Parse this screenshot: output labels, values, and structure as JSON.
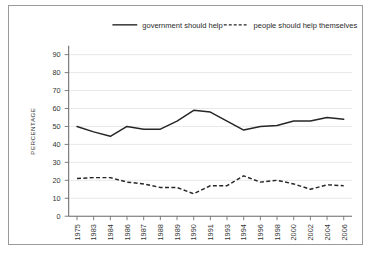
{
  "chart_data": {
    "type": "line",
    "title": "",
    "subtitle": "",
    "xlabel": "",
    "ylabel": "PERCENTAGE",
    "ylim": [
      0,
      95
    ],
    "yticks": [
      0,
      10,
      20,
      30,
      40,
      50,
      60,
      70,
      80,
      90
    ],
    "ytick_labels": [
      "0",
      "10",
      "20",
      "30",
      "40",
      "50",
      "60",
      "70",
      "80",
      "90"
    ],
    "grid": true,
    "grid_axis": "y",
    "legend_position": "top",
    "categories": [
      "1975",
      "1983",
      "1984",
      "1986",
      "1987",
      "1988",
      "1989",
      "1990",
      "1991",
      "1993",
      "1994",
      "1996",
      "1998",
      "2000",
      "2002",
      "2004",
      "2006"
    ],
    "series": [
      {
        "name": "government should help",
        "style": "solid",
        "color": "#262626",
        "values": [
          50,
          47,
          44.5,
          50,
          48.5,
          48.5,
          53,
          59,
          58,
          53,
          48,
          50,
          50.5,
          53,
          53,
          55,
          54
        ]
      },
      {
        "name": "people should help themselves",
        "style": "dashed",
        "color": "#262626",
        "values": [
          21,
          21.5,
          21.5,
          19,
          18,
          16,
          16,
          12.5,
          17,
          17,
          22.5,
          19,
          20,
          18,
          15,
          17.5,
          17
        ]
      }
    ]
  },
  "legend": {
    "items": [
      {
        "label": "government should help",
        "style": "solid"
      },
      {
        "label": "people should help themselves",
        "style": "dashed"
      }
    ]
  },
  "axes": {
    "y_axis_title": "PERCENTAGE"
  }
}
